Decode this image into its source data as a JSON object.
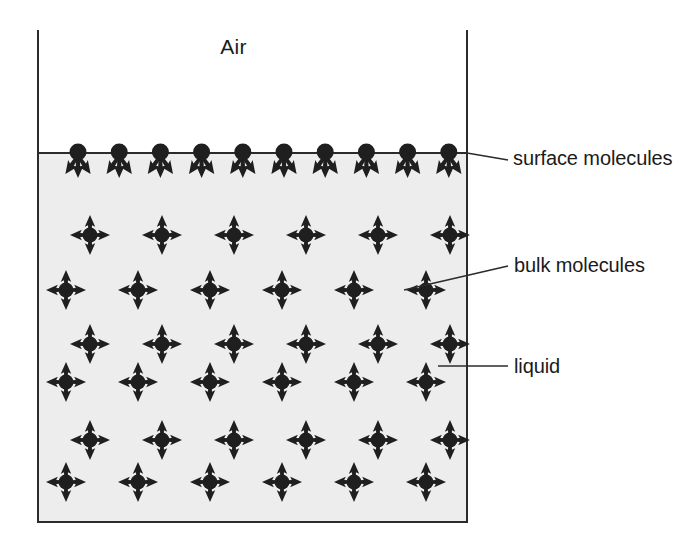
{
  "diagram": {
    "title_text": "Air",
    "colors": {
      "liquid_fill": "#ededed",
      "container_line": "#2b2b2b",
      "molecule": "#1f1f1f",
      "text": "#1b1b1b",
      "background": "#ffffff"
    },
    "container": {
      "left": 38,
      "right": 467,
      "top": 30,
      "bottom": 522,
      "surface_y": 153,
      "line_width": 2
    },
    "regions": [
      {
        "name": "air",
        "label": "Air"
      },
      {
        "name": "liquid",
        "label": "liquid"
      }
    ],
    "labels": [
      {
        "id": "air",
        "text": "Air",
        "has_leader": false
      },
      {
        "id": "surface",
        "text": "surface molecules",
        "has_leader": true,
        "leader": {
          "x1": 467,
          "y1": 153,
          "x2": 508,
          "y2": 160
        }
      },
      {
        "id": "bulk",
        "text": "bulk molecules",
        "has_leader": true,
        "leader": {
          "x1": 404,
          "y1": 290,
          "x2": 508,
          "y2": 266
        }
      },
      {
        "id": "liquid",
        "text": "liquid",
        "has_leader": true,
        "leader": {
          "x1": 438,
          "y1": 366,
          "x2": 508,
          "y2": 366
        }
      }
    ],
    "surface_row": {
      "count": 10,
      "y": 153,
      "x_start": 78,
      "x_step": 41.2,
      "arrow_directions": [
        "down-left",
        "down",
        "down-right"
      ],
      "note": "no upward arrows - net inward force"
    },
    "bulk_rows": [
      {
        "count": 6,
        "y": 235,
        "x_start": 90,
        "x_step": 72
      },
      {
        "count": 6,
        "y": 290,
        "x_start": 66,
        "x_step": 72
      },
      {
        "count": 6,
        "y": 344,
        "x_start": 90,
        "x_step": 72
      },
      {
        "count": 6,
        "y": 382,
        "x_start": 66,
        "x_step": 72
      },
      {
        "count": 6,
        "y": 440,
        "x_start": 90,
        "x_step": 72
      },
      {
        "count": 6,
        "y": 482,
        "x_start": 66,
        "x_step": 72
      }
    ],
    "bulk_arrow_directions": [
      "up",
      "down",
      "left",
      "right"
    ],
    "molecule": {
      "bulk_dot_radius": 7.5,
      "surface_dot_radius": 8.5,
      "arrow_length": 20,
      "surface_arrow_length": 22
    }
  }
}
